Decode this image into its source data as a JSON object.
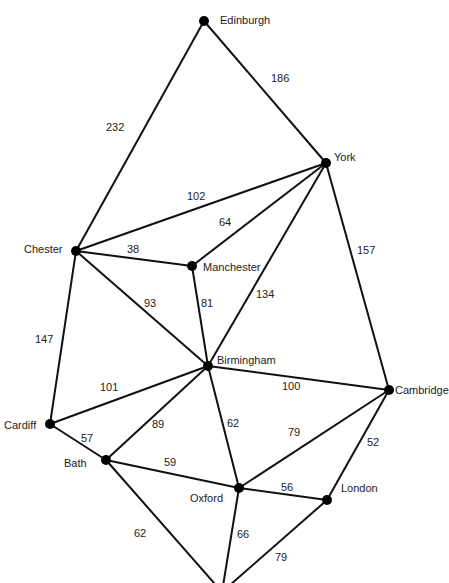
{
  "diagram": {
    "type": "weighted-graph",
    "nodes": [
      {
        "id": "edinburgh",
        "label": "Edinburgh",
        "x": 204,
        "y": 21,
        "lx": 220,
        "ly": 15
      },
      {
        "id": "york",
        "label": "York",
        "x": 326,
        "y": 163,
        "lx": 334,
        "ly": 152
      },
      {
        "id": "chester",
        "label": "Chester",
        "x": 76,
        "y": 251,
        "lx": 24,
        "ly": 244
      },
      {
        "id": "manchester",
        "label": "Manchester",
        "x": 192,
        "y": 266,
        "lx": 203,
        "ly": 262
      },
      {
        "id": "birmingham",
        "label": "Birmingham",
        "x": 208,
        "y": 366,
        "lx": 217,
        "ly": 355
      },
      {
        "id": "cambridge",
        "label": "Cambridge",
        "x": 389,
        "y": 390,
        "lx": 395,
        "ly": 385
      },
      {
        "id": "cardiff",
        "label": "Cardiff",
        "x": 50,
        "y": 424,
        "lx": 4,
        "ly": 420
      },
      {
        "id": "bath",
        "label": "Bath",
        "x": 106,
        "y": 460,
        "lx": 64,
        "ly": 458
      },
      {
        "id": "oxford",
        "label": "Oxford",
        "x": 239,
        "y": 488,
        "lx": 190,
        "ly": 493
      },
      {
        "id": "london",
        "label": "London",
        "x": 327,
        "y": 500,
        "lx": 341,
        "ly": 483
      },
      {
        "id": "bottom",
        "label": "",
        "x": 222,
        "y": 592,
        "lx": 0,
        "ly": 0
      }
    ],
    "edges": [
      {
        "from": "edinburgh",
        "to": "york",
        "weight": "186",
        "wx": 271,
        "wy": 73
      },
      {
        "from": "edinburgh",
        "to": "chester",
        "weight": "232",
        "wx": 106,
        "wy": 122
      },
      {
        "from": "york",
        "to": "chester",
        "weight": "102",
        "wx": 187,
        "wy": 191
      },
      {
        "from": "york",
        "to": "manchester",
        "weight": "64",
        "wx": 219,
        "wy": 217
      },
      {
        "from": "york",
        "to": "birmingham",
        "weight": "134",
        "wx": 256,
        "wy": 289
      },
      {
        "from": "york",
        "to": "cambridge",
        "weight": "157",
        "wx": 357,
        "wy": 245
      },
      {
        "from": "chester",
        "to": "manchester",
        "weight": "38",
        "wx": 127,
        "wy": 244
      },
      {
        "from": "chester",
        "to": "birmingham",
        "weight": "93",
        "wx": 144,
        "wy": 298
      },
      {
        "from": "chester",
        "to": "cardiff",
        "weight": "147",
        "wx": 35,
        "wy": 334
      },
      {
        "from": "manchester",
        "to": "birmingham",
        "weight": "81",
        "wx": 201,
        "wy": 298
      },
      {
        "from": "birmingham",
        "to": "cambridge",
        "weight": "100",
        "wx": 282,
        "wy": 381
      },
      {
        "from": "birmingham",
        "to": "cardiff",
        "weight": "101",
        "wx": 100,
        "wy": 382
      },
      {
        "from": "birmingham",
        "to": "bath",
        "weight": "89",
        "wx": 152,
        "wy": 419
      },
      {
        "from": "birmingham",
        "to": "oxford",
        "weight": "62",
        "wx": 227,
        "wy": 418
      },
      {
        "from": "cambridge",
        "to": "oxford",
        "weight": "79",
        "wx": 288,
        "wy": 427
      },
      {
        "from": "cambridge",
        "to": "london",
        "weight": "52",
        "wx": 367,
        "wy": 437
      },
      {
        "from": "cardiff",
        "to": "bath",
        "weight": "57",
        "wx": 81,
        "wy": 433
      },
      {
        "from": "bath",
        "to": "oxford",
        "weight": "59",
        "wx": 164,
        "wy": 457
      },
      {
        "from": "bath",
        "to": "bottom",
        "weight": "62",
        "wx": 134,
        "wy": 528
      },
      {
        "from": "oxford",
        "to": "london",
        "weight": "56",
        "wx": 281,
        "wy": 482
      },
      {
        "from": "oxford",
        "to": "bottom",
        "weight": "66",
        "wx": 237,
        "wy": 529
      },
      {
        "from": "london",
        "to": "bottom",
        "weight": "79",
        "wx": 275,
        "wy": 552
      }
    ]
  }
}
